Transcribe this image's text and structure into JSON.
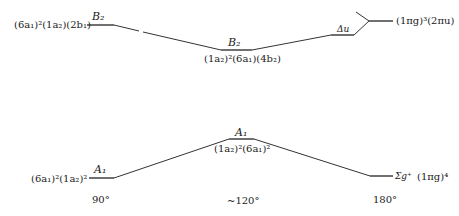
{
  "diagram": {
    "type": "correlation-diagram",
    "upper_state": {
      "left_config": "(6a₁)²(1a₂)(2b₁)",
      "left_symmetry": "B₂",
      "middle_symmetry": "B₂",
      "middle_config": "(1a₂)²(6a₁)(4b₂)",
      "right_symmetry": "Δu",
      "right_config": "(1πg)³(2πu)"
    },
    "lower_state": {
      "left_config": "(6a₁)²(1a₂)²",
      "left_symmetry": "A₁",
      "middle_symmetry": "A₁",
      "middle_config": "(1a₂)²(6a₁)²",
      "right_symmetry": "Σg⁺",
      "right_config": "(1πg)⁴"
    },
    "angles": [
      "90°",
      "~120°",
      "180°"
    ],
    "line_color": "#333333"
  }
}
